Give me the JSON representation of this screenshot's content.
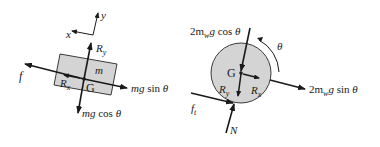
{
  "colors": {
    "ink": "#1a1a1a",
    "body_fill": "#d4d4d4",
    "body_stroke": "#3a3a3a"
  },
  "left_diagram": {
    "axes": {
      "x_label": "x",
      "y_label": "y"
    },
    "body_label": "m",
    "center_label": "G",
    "forces": {
      "friction": "f",
      "reaction_x": "R",
      "reaction_x_sub": "x",
      "reaction_y": "R",
      "reaction_y_sub": "y",
      "weight_parallel_a": "mg",
      "weight_parallel_b": " sin ",
      "weight_parallel_c": "θ",
      "weight_normal_a": "mg",
      "weight_normal_b": " cos ",
      "weight_normal_c": "θ"
    }
  },
  "right_diagram": {
    "center_label": "G",
    "rotation_label": "θ",
    "forces": {
      "weight_normal_a": "2m",
      "weight_normal_sub": "w",
      "weight_normal_b": "g",
      "weight_normal_c": " cos ",
      "weight_normal_d": "θ",
      "weight_parallel_a": "2m",
      "weight_parallel_sub": "w",
      "weight_parallel_b": "g",
      "weight_parallel_c": " sin ",
      "weight_parallel_d": "θ",
      "reaction_x": "R",
      "reaction_x_sub": "x",
      "reaction_y": "R",
      "reaction_y_sub": "y",
      "traction": "f",
      "traction_sub": "t",
      "normal": "N"
    }
  }
}
